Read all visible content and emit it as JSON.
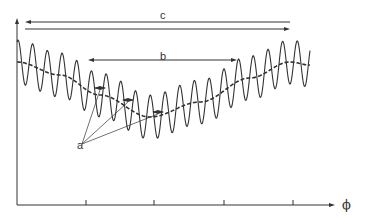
{
  "diagram": {
    "labels": {
      "c": "c",
      "b": "b",
      "a": "a",
      "x_axis": "ϕ"
    },
    "axis": {
      "origin": [
        17,
        205
      ],
      "y_top": 18,
      "x_end": 335,
      "x_ticks_px": [
        86,
        154,
        224,
        293
      ]
    },
    "wave": {
      "x_start": 17,
      "x_end": 310,
      "period_px": 14.7,
      "amplitude_px": 22,
      "envelope_points": [
        [
          17,
          62
        ],
        [
          60,
          75
        ],
        [
          100,
          95
        ],
        [
          150,
          117
        ],
        [
          200,
          102
        ],
        [
          250,
          78
        ],
        [
          290,
          62
        ],
        [
          310,
          65
        ]
      ]
    },
    "dimension_arrows": {
      "c": {
        "y_top": 22,
        "y_bottom": 29,
        "x_left": 25,
        "x_right": 290
      },
      "b": {
        "y": 60,
        "x_left": 88,
        "x_right": 237
      }
    },
    "markers_a": [
      [
        100,
        88
      ],
      [
        128,
        100
      ],
      [
        158,
        112
      ]
    ],
    "colors": {
      "line": "#333333",
      "background": "#ffffff"
    }
  }
}
